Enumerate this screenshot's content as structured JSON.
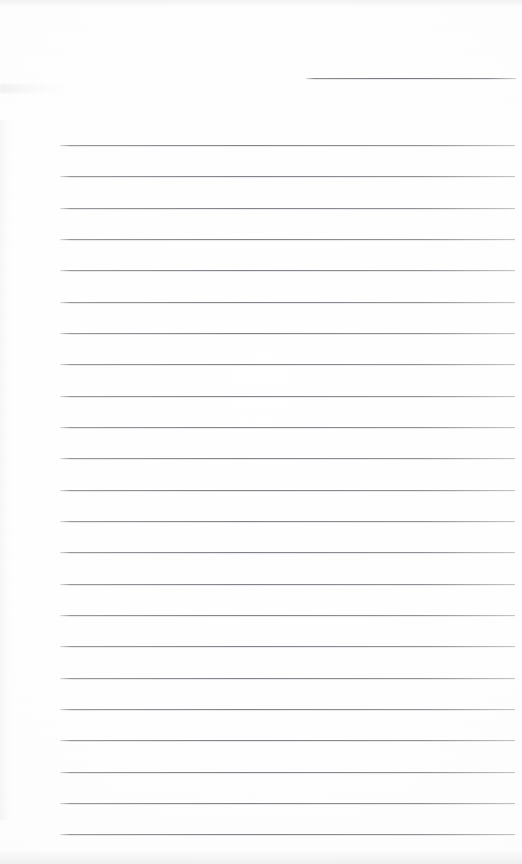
{
  "document": {
    "kind": "scanned-lined-notebook-page",
    "page_width": 522,
    "page_height": 864,
    "background_color": "#fefefe",
    "rule_color": "#80808a",
    "text_content": "",
    "has_handwriting": false,
    "notes": "Blank ruled paper scan: one short rule at top right, followed by full-width horizontal ruled lines."
  },
  "rules": {
    "short_rule": {
      "id": "short-rule-top",
      "x": 306,
      "y": 78,
      "width": 210
    },
    "left_margin_x": 60,
    "right_edge_x": 515,
    "line_width": 455,
    "first_line_y": 145,
    "spacing": 31.3,
    "count": 23,
    "lines": [
      {
        "index": 1,
        "y": 145
      },
      {
        "index": 2,
        "y": 176
      },
      {
        "index": 3,
        "y": 208
      },
      {
        "index": 4,
        "y": 239
      },
      {
        "index": 5,
        "y": 270
      },
      {
        "index": 6,
        "y": 302
      },
      {
        "index": 7,
        "y": 333
      },
      {
        "index": 8,
        "y": 364
      },
      {
        "index": 9,
        "y": 396
      },
      {
        "index": 10,
        "y": 427
      },
      {
        "index": 11,
        "y": 458
      },
      {
        "index": 12,
        "y": 490
      },
      {
        "index": 13,
        "y": 521
      },
      {
        "index": 14,
        "y": 552
      },
      {
        "index": 15,
        "y": 584
      },
      {
        "index": 16,
        "y": 615
      },
      {
        "index": 17,
        "y": 646
      },
      {
        "index": 18,
        "y": 678
      },
      {
        "index": 19,
        "y": 709
      },
      {
        "index": 20,
        "y": 740
      },
      {
        "index": 21,
        "y": 772
      },
      {
        "index": 22,
        "y": 803
      },
      {
        "index": 23,
        "y": 834
      }
    ]
  }
}
